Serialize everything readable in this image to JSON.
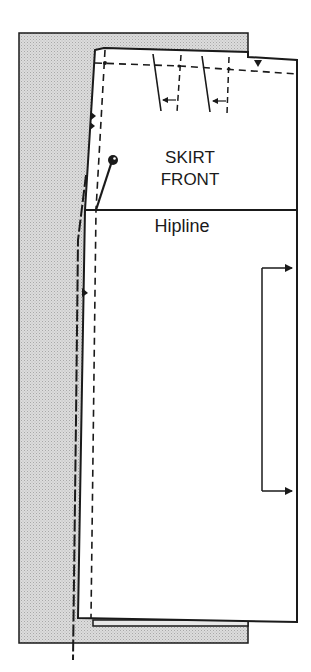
{
  "diagram": {
    "title_line1": "SKIRT",
    "title_line2": "FRONT",
    "hipline_label": "Hipline",
    "colors": {
      "ink": "#1a1a1a",
      "backing_fill": "#d6d6d6",
      "pattern_fill": "#ffffff",
      "background": "#ffffff"
    },
    "elements": [
      "backing-fabric-layer",
      "skirt-front-pattern-piece",
      "waist-seam-dashed-line",
      "side-seam-dashed-line",
      "two-darts-with-arrows",
      "hip-notch-markers",
      "straight-pin",
      "hipline",
      "grainline-bracket-arrow"
    ]
  }
}
